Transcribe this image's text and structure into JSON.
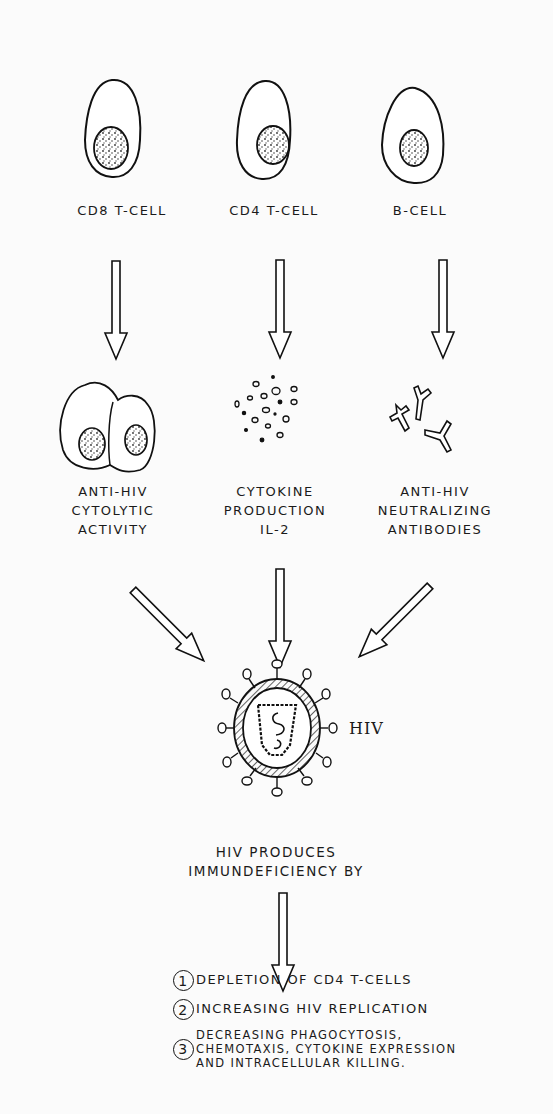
{
  "diagram": {
    "cells": [
      {
        "id": "cd8",
        "label": "CD8 T-CELL",
        "product_lines": [
          "ANTI-HIV",
          "CYTOLYTIC",
          "ACTIVITY"
        ]
      },
      {
        "id": "cd4",
        "label": "CD4 T-CELL",
        "product_lines": [
          "CYTOKINE",
          "PRODUCTION",
          "IL-2"
        ]
      },
      {
        "id": "b",
        "label": "B-CELL",
        "product_lines": [
          "ANTI-HIV",
          "NEUTRALIZING",
          "ANTIBODIES"
        ]
      }
    ],
    "virus_label": "HIV",
    "conclusion_lines": [
      "HIV PRODUCES",
      "IMMUNDEFICIENCY BY"
    ],
    "mechanisms": [
      {
        "number": "1",
        "lines": [
          "DEPLETION OF CD4 T-CELLS"
        ]
      },
      {
        "number": "2",
        "lines": [
          "INCREASING HIV REPLICATION"
        ]
      },
      {
        "number": "3",
        "lines": [
          "DECREASING PHAGOCYTOSIS,",
          "CHEMOTAXIS, CYTOKINE EXPRESSION",
          "AND INTRACELLULAR KILLING."
        ]
      }
    ]
  }
}
